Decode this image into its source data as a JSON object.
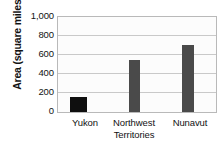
{
  "chart_data": {
    "type": "bar",
    "title": "",
    "xlabel": "",
    "ylabel": "Area (square miles)",
    "categories": [
      "Yukon",
      "Northwest Territories",
      "Nunavut"
    ],
    "values": [
      160,
      550,
      710
    ],
    "ylim": [
      0,
      1000
    ],
    "yticks": [
      0,
      200,
      400,
      600,
      800,
      1000
    ],
    "ytick_labels": [
      "0",
      "200",
      "400",
      "600",
      "800",
      "1,000"
    ],
    "grid": true,
    "legend": "none",
    "bar_colors": [
      "#0f0f0f",
      "#4a4a4a",
      "#4a4a4a"
    ],
    "plot_background": "#fcfcfc",
    "gridline_color": "#c9c9c9",
    "axis_border_color": "#b9b9b9",
    "text_color": "#121212"
  },
  "axis": {
    "y_title": "Area (square miles)",
    "x_labels": [
      {
        "line1": "Yukon",
        "line2": ""
      },
      {
        "line1": "Northwest",
        "line2": "Territories"
      },
      {
        "line1": "Nunavut",
        "line2": ""
      }
    ]
  }
}
